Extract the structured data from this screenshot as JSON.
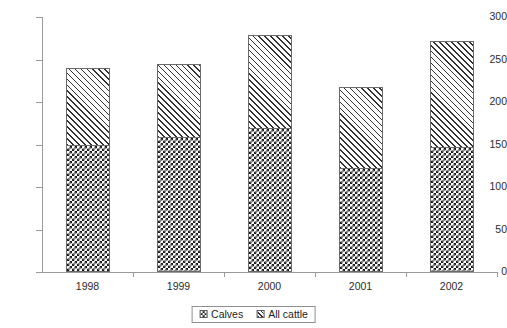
{
  "chart_data": {
    "type": "bar",
    "stacked": true,
    "title": "",
    "xlabel": "",
    "ylabel": "",
    "categories": [
      "1998",
      "1999",
      "2000",
      "2001",
      "2002"
    ],
    "series": [
      {
        "name": "Calves",
        "values": [
          150,
          159,
          169,
          122,
          147
        ],
        "pattern": "checkerboard"
      },
      {
        "name": "All cattle",
        "values": [
          90,
          86,
          110,
          96,
          125
        ],
        "pattern": "diagonal-hatch"
      }
    ],
    "stack_totals": [
      240,
      245,
      279,
      218,
      272
    ],
    "ylim": [
      0,
      300
    ],
    "yticks": [
      0,
      50,
      100,
      150,
      200,
      250,
      300
    ],
    "ytick_labels": [
      "0",
      "50",
      "100",
      "150",
      "200",
      "250",
      "300"
    ],
    "grid": false,
    "legend_position": "bottom"
  },
  "legend": {
    "items": [
      {
        "label": "Calves",
        "swatch": "checkerboard-swatch"
      },
      {
        "label": "All cattle",
        "swatch": "diagonal-hatch-swatch"
      }
    ]
  },
  "colors": {
    "axis": "#9a9a9a",
    "text": "#2b2b2b",
    "bar_outline": "#6a6a6a",
    "pattern_dark": "#1a1a1a",
    "background": "#ffffff"
  }
}
